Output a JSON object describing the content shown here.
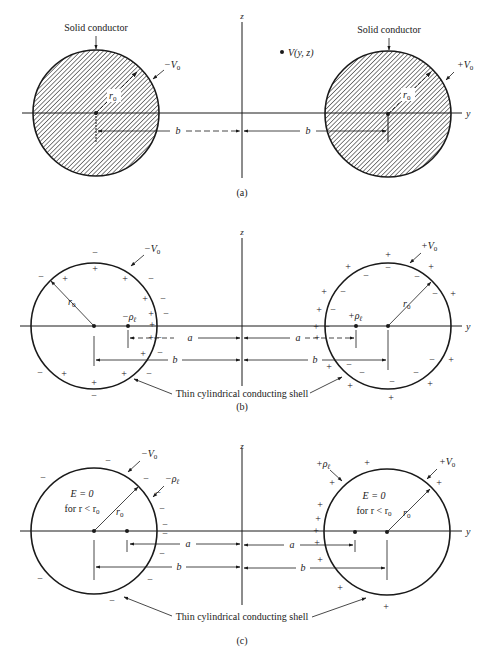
{
  "figure": {
    "panels": [
      {
        "id": "a",
        "caption": "(a)",
        "axis_z": "z",
        "axis_y": "y",
        "left_label": "Solid conductor",
        "right_label": "Solid conductor",
        "left_potential": "−V",
        "right_potential": "+V",
        "potential_sub": "0",
        "radius_label": "r",
        "radius_sub": "0",
        "b_label": "b",
        "point_label": "V(y, z)"
      },
      {
        "id": "b",
        "caption": "(b)",
        "axis_z": "z",
        "axis_y": "y",
        "left_potential": "−V",
        "right_potential": "+V",
        "potential_sub": "0",
        "radius_label": "r",
        "radius_sub": "0",
        "left_line_charge": "−ρ",
        "right_line_charge": "+ρ",
        "charge_sub": "ℓ",
        "a_label": "a",
        "b_label": "b",
        "shell_label": "Thin cylindrical conducting shell"
      },
      {
        "id": "c",
        "caption": "(c)",
        "axis_z": "z",
        "axis_y": "y",
        "left_potential": "−V",
        "right_potential": "+V",
        "potential_sub": "0",
        "radius_label": "r",
        "radius_sub": "0",
        "left_line_charge": "−ρ",
        "right_line_charge": "+ρ",
        "charge_sub": "ℓ",
        "field_label": "E = 0",
        "field_cond": "for r < r",
        "field_cond_sub": "0",
        "a_label": "a",
        "b_label": "b",
        "shell_label": "Thin cylindrical conducting shell"
      }
    ],
    "colors": {
      "ink": "#1a1a1a",
      "background": "#ffffff"
    }
  }
}
